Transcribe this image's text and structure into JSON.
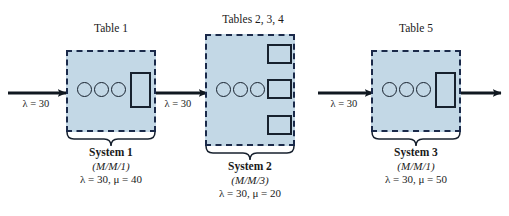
{
  "figure": {
    "type": "queueing-network-diagram",
    "background_color": "#ffffff",
    "box_fill_color": "#c3d8e6",
    "box_border_color": "#1b2a4a",
    "shape_color": "#17212e"
  },
  "flow": {
    "entry_arrow_label": "λ  =  30",
    "link1_label": "λ  =  30",
    "link2_label": "λ  =  30",
    "exit_arrow_label": ""
  },
  "systems": [
    {
      "id": "system-1",
      "table_label": "Table 1",
      "caption_title": "System 1",
      "caption_notation": "(M/M/1)",
      "caption_rates": "λ  =  30, μ  =  40",
      "queue_circles": 3,
      "servers": 1,
      "lambda": 30,
      "mu": 40
    },
    {
      "id": "system-2",
      "table_label": "Tables 2, 3, 4",
      "caption_title": "System 2",
      "caption_notation": "(M/M/3)",
      "caption_rates": "λ  =  30, μ  =  20",
      "queue_circles": 3,
      "servers": 3,
      "lambda": 30,
      "mu": 20
    },
    {
      "id": "system-3",
      "table_label": "Table 5",
      "caption_title": "System 3",
      "caption_notation": "(M/M/1)",
      "caption_rates": "λ  =  30, μ  =  50",
      "queue_circles": 3,
      "servers": 1,
      "lambda": 30,
      "mu": 50
    }
  ]
}
